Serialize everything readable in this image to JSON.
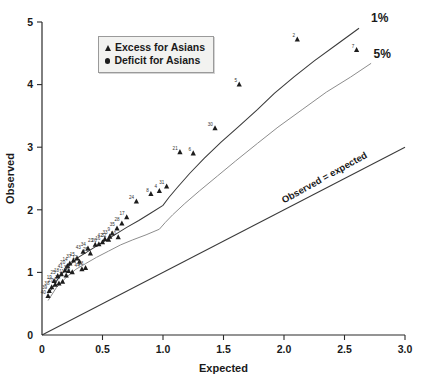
{
  "chart_data": {
    "type": "scatter",
    "title": "",
    "xlabel": "Expected",
    "ylabel": "Observed",
    "xlim": [
      0,
      3.0
    ],
    "ylim": [
      0,
      5
    ],
    "xticks": [
      "0",
      "0.5",
      "1.0",
      "1.5",
      "2.0",
      "2.5",
      "3.0"
    ],
    "xtick_values": [
      0,
      0.5,
      1.0,
      1.5,
      2.0,
      2.5,
      3.0
    ],
    "yticks": [
      "0",
      "1",
      "2",
      "3",
      "4",
      "5"
    ],
    "ytick_values": [
      0,
      1,
      2,
      3,
      4,
      5
    ],
    "grid": false,
    "legend_position": "top-left",
    "legend": [
      {
        "marker": "triangle",
        "label": "Excess for Asians"
      },
      {
        "marker": "circle",
        "label": "Deficit for Asians"
      }
    ],
    "annotations": [
      {
        "text": "1%",
        "x": 2.72,
        "y": 5.0,
        "role": "upper-band-label"
      },
      {
        "text": "5%",
        "x": 2.74,
        "y": 4.42,
        "role": "lower-band-label"
      },
      {
        "text": "Observed = expected",
        "x": 2.0,
        "y": 2.1,
        "role": "identity-line-label",
        "rotation": -29
      }
    ],
    "series": [
      {
        "name": "Excess for Asians",
        "marker": "triangle",
        "points": [
          {
            "label": "2",
            "x": 2.11,
            "y": 4.72
          },
          {
            "label": "7",
            "x": 2.6,
            "y": 4.55
          },
          {
            "label": "5",
            "x": 1.63,
            "y": 4.0
          },
          {
            "label": "30",
            "x": 1.43,
            "y": 3.3
          },
          {
            "label": "21",
            "x": 1.14,
            "y": 2.92
          },
          {
            "label": "6",
            "x": 1.25,
            "y": 2.9
          },
          {
            "label": "31",
            "x": 1.03,
            "y": 2.37
          },
          {
            "label": "4",
            "x": 0.97,
            "y": 2.3
          },
          {
            "label": "8",
            "x": 0.9,
            "y": 2.25
          },
          {
            "label": "24",
            "x": 0.78,
            "y": 2.13
          },
          {
            "label": "17",
            "x": 0.7,
            "y": 1.88
          },
          {
            "label": "28",
            "x": 0.66,
            "y": 1.78
          },
          {
            "label": "35",
            "x": 0.62,
            "y": 1.7
          },
          {
            "label": "9",
            "x": 0.58,
            "y": 1.62
          },
          {
            "label": "10",
            "x": 0.63,
            "y": 1.56
          },
          {
            "label": "33",
            "x": 0.56,
            "y": 1.57
          },
          {
            "label": "42",
            "x": 0.52,
            "y": 1.53
          },
          {
            "label": "32",
            "x": 0.55,
            "y": 1.52
          },
          {
            "label": "16",
            "x": 0.5,
            "y": 1.48
          },
          {
            "label": "23",
            "x": 0.44,
            "y": 1.44
          },
          {
            "label": "26",
            "x": 0.47,
            "y": 1.45
          },
          {
            "label": "34",
            "x": 0.38,
            "y": 1.38
          },
          {
            "label": "43",
            "x": 0.34,
            "y": 1.33
          },
          {
            "label": "29",
            "x": 0.4,
            "y": 1.3
          },
          {
            "label": "15",
            "x": 0.29,
            "y": 1.22
          },
          {
            "label": "37",
            "x": 0.26,
            "y": 1.19
          },
          {
            "label": "12",
            "x": 0.31,
            "y": 1.17
          },
          {
            "label": "14",
            "x": 0.23,
            "y": 1.14
          },
          {
            "label": "20",
            "x": 0.21,
            "y": 1.1
          },
          {
            "label": "41",
            "x": 0.19,
            "y": 1.03
          },
          {
            "label": "13",
            "x": 0.36,
            "y": 1.07
          },
          {
            "label": "44",
            "x": 0.33,
            "y": 1.05
          },
          {
            "label": "3",
            "x": 0.22,
            "y": 1.02
          },
          {
            "label": "36",
            "x": 0.25,
            "y": 1.0
          },
          {
            "label": "11",
            "x": 0.2,
            "y": 0.95
          },
          {
            "label": "18",
            "x": 0.16,
            "y": 0.97
          },
          {
            "label": "25",
            "x": 0.13,
            "y": 0.94
          },
          {
            "label": "19",
            "x": 0.1,
            "y": 0.86
          },
          {
            "label": "22",
            "x": 0.17,
            "y": 0.85
          },
          {
            "label": "1",
            "x": 0.14,
            "y": 0.82
          },
          {
            "label": "27",
            "x": 0.11,
            "y": 0.8
          },
          {
            "label": "38",
            "x": 0.08,
            "y": 0.76
          },
          {
            "label": "39",
            "x": 0.06,
            "y": 0.7
          },
          {
            "label": "40",
            "x": 0.05,
            "y": 0.62
          }
        ]
      }
    ],
    "reference_lines": [
      {
        "name": "identity",
        "label": "Observed = expected",
        "points": [
          [
            0,
            0
          ],
          [
            3.0,
            3.0
          ]
        ]
      },
      {
        "name": "5% band",
        "label": "5%",
        "points": [
          [
            0.05,
            0.55
          ],
          [
            0.12,
            0.76
          ],
          [
            0.2,
            0.92
          ],
          [
            0.28,
            1.05
          ],
          [
            0.36,
            1.14
          ],
          [
            0.45,
            1.24
          ],
          [
            0.55,
            1.34
          ],
          [
            0.65,
            1.44
          ],
          [
            0.75,
            1.52
          ],
          [
            0.86,
            1.6
          ],
          [
            0.97,
            1.69
          ],
          [
            1.02,
            1.8
          ],
          [
            1.08,
            1.92
          ],
          [
            1.18,
            2.1
          ],
          [
            1.3,
            2.3
          ],
          [
            1.45,
            2.54
          ],
          [
            1.6,
            2.78
          ],
          [
            1.78,
            3.06
          ],
          [
            1.95,
            3.32
          ],
          [
            2.15,
            3.6
          ],
          [
            2.35,
            3.88
          ],
          [
            2.55,
            4.12
          ],
          [
            2.72,
            4.34
          ]
        ]
      },
      {
        "name": "1% band",
        "label": "1%",
        "points": [
          [
            0.06,
            0.68
          ],
          [
            0.14,
            0.92
          ],
          [
            0.22,
            1.1
          ],
          [
            0.3,
            1.24
          ],
          [
            0.4,
            1.36
          ],
          [
            0.5,
            1.48
          ],
          [
            0.6,
            1.6
          ],
          [
            0.7,
            1.72
          ],
          [
            0.8,
            1.83
          ],
          [
            0.9,
            1.95
          ],
          [
            1.0,
            2.07
          ],
          [
            1.05,
            2.2
          ],
          [
            1.12,
            2.36
          ],
          [
            1.22,
            2.58
          ],
          [
            1.34,
            2.82
          ],
          [
            1.48,
            3.08
          ],
          [
            1.62,
            3.32
          ],
          [
            1.78,
            3.6
          ],
          [
            1.92,
            3.86
          ],
          [
            2.08,
            4.12
          ],
          [
            2.25,
            4.38
          ],
          [
            2.45,
            4.66
          ],
          [
            2.62,
            4.9
          ]
        ]
      }
    ]
  }
}
